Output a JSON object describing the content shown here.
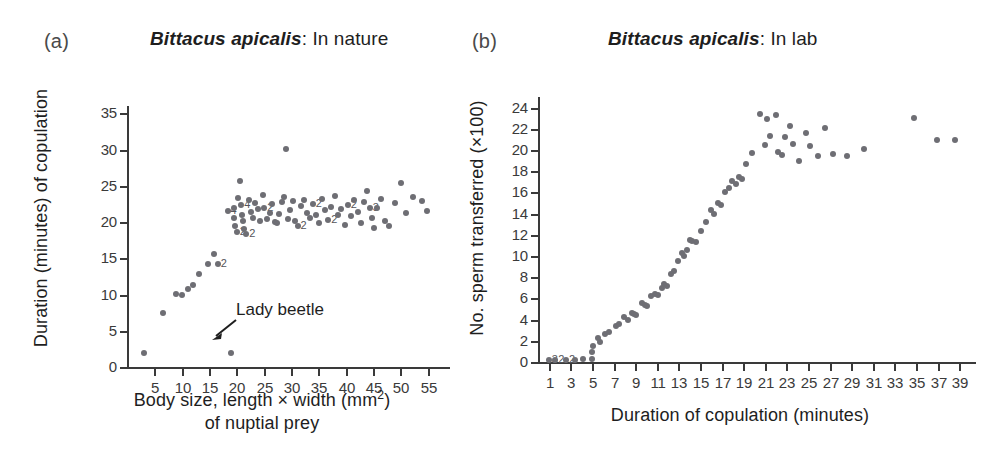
{
  "figure": {
    "background": "#ffffff",
    "dot_color": "#6e6e74",
    "axis_color": "#3a3a3a"
  },
  "panel_a": {
    "letter": "(a)",
    "title_species": "Bittacus apicalis",
    "title_rest": ": In nature",
    "xlabel_line1_pre": "Body size, length × width (mm",
    "xlabel_line1_sup": "2",
    "xlabel_line1_post": ")",
    "xlabel_line2": "of nuptial prey",
    "ylabel": "Duration (minutes) of copulation",
    "annotation": "Lady beetle"
  },
  "panel_b": {
    "letter": "(b)",
    "title_species": "Bittacus apicalis",
    "title_rest": ": In lab",
    "xlabel": "Duration of copulation (minutes)",
    "ylabel": "No. sperm transferred (×100)"
  },
  "chart_data": [
    {
      "type": "scatter",
      "panel": "a",
      "title": "Bittacus apicalis: In nature",
      "xlabel": "Body size, length x width (mm2) of nuptial prey",
      "ylabel": "Duration (minutes) of copulation",
      "xlim": [
        0,
        58
      ],
      "ylim": [
        0,
        36
      ],
      "xticks": [
        5,
        10,
        15,
        20,
        25,
        30,
        35,
        40,
        45,
        50,
        55
      ],
      "yticks": [
        0,
        5,
        10,
        15,
        20,
        25,
        30,
        35
      ],
      "grid": false,
      "legend": null,
      "annotations": [
        {
          "text": "Lady beetle",
          "points_to_x": 19.0,
          "points_to_y": 2.0
        }
      ],
      "points": [
        {
          "x": 3.2,
          "y": 2.0
        },
        {
          "x": 6.6,
          "y": 7.4
        },
        {
          "x": 9.0,
          "y": 10.1
        },
        {
          "x": 10.1,
          "y": 10.0
        },
        {
          "x": 11.2,
          "y": 10.8
        },
        {
          "x": 12.1,
          "y": 11.3
        },
        {
          "x": 13.1,
          "y": 12.8
        },
        {
          "x": 14.9,
          "y": 14.2
        },
        {
          "x": 16.0,
          "y": 15.6
        },
        {
          "x": 16.6,
          "y": 14.2,
          "n": 2
        },
        {
          "x": 19.0,
          "y": 2.0
        },
        {
          "x": 18.4,
          "y": 21.5,
          "n": 4
        },
        {
          "x": 19.6,
          "y": 22.0
        },
        {
          "x": 19.6,
          "y": 20.6
        },
        {
          "x": 19.8,
          "y": 19.5
        },
        {
          "x": 20.1,
          "y": 18.6,
          "n": 2
        },
        {
          "x": 20.3,
          "y": 23.3
        },
        {
          "x": 20.6,
          "y": 25.7
        },
        {
          "x": 20.9,
          "y": 22.3,
          "n": 4
        },
        {
          "x": 21.0,
          "y": 21.0
        },
        {
          "x": 21.2,
          "y": 20.2
        },
        {
          "x": 21.4,
          "y": 19.0
        },
        {
          "x": 21.8,
          "y": 18.4,
          "n": 2
        },
        {
          "x": 22.3,
          "y": 23.1
        },
        {
          "x": 22.6,
          "y": 21.4
        },
        {
          "x": 23.0,
          "y": 20.5
        },
        {
          "x": 23.4,
          "y": 22.6
        },
        {
          "x": 23.9,
          "y": 21.8
        },
        {
          "x": 24.3,
          "y": 20.2
        },
        {
          "x": 24.8,
          "y": 23.7
        },
        {
          "x": 25.1,
          "y": 22.0,
          "n": 2
        },
        {
          "x": 25.6,
          "y": 20.4
        },
        {
          "x": 26.1,
          "y": 21.3
        },
        {
          "x": 26.6,
          "y": 22.5
        },
        {
          "x": 27.0,
          "y": 20.0
        },
        {
          "x": 27.4,
          "y": 19.9
        },
        {
          "x": 27.9,
          "y": 21.1
        },
        {
          "x": 28.3,
          "y": 22.8
        },
        {
          "x": 28.7,
          "y": 23.4
        },
        {
          "x": 29.1,
          "y": 30.1
        },
        {
          "x": 29.4,
          "y": 20.4
        },
        {
          "x": 29.9,
          "y": 21.7
        },
        {
          "x": 30.3,
          "y": 22.9
        },
        {
          "x": 30.8,
          "y": 20.1
        },
        {
          "x": 31.2,
          "y": 19.4,
          "n": 2
        },
        {
          "x": 31.9,
          "y": 22.2
        },
        {
          "x": 32.4,
          "y": 23.0
        },
        {
          "x": 32.9,
          "y": 21.2
        },
        {
          "x": 33.4,
          "y": 20.6
        },
        {
          "x": 34.0,
          "y": 22.5,
          "n": 2
        },
        {
          "x": 34.6,
          "y": 21.0
        },
        {
          "x": 35.1,
          "y": 19.8
        },
        {
          "x": 35.7,
          "y": 23.2
        },
        {
          "x": 36.2,
          "y": 21.6
        },
        {
          "x": 36.8,
          "y": 20.3,
          "n": 2
        },
        {
          "x": 37.4,
          "y": 22.1
        },
        {
          "x": 38.0,
          "y": 23.6
        },
        {
          "x": 38.6,
          "y": 20.9
        },
        {
          "x": 39.2,
          "y": 21.8
        },
        {
          "x": 39.8,
          "y": 19.6
        },
        {
          "x": 40.4,
          "y": 22.4,
          "n": 2
        },
        {
          "x": 41.0,
          "y": 20.8
        },
        {
          "x": 41.6,
          "y": 23.0
        },
        {
          "x": 42.2,
          "y": 21.4
        },
        {
          "x": 42.8,
          "y": 19.9
        },
        {
          "x": 43.4,
          "y": 22.7
        },
        {
          "x": 44.0,
          "y": 24.3
        },
        {
          "x": 44.4,
          "y": 22.0,
          "n": 3
        },
        {
          "x": 44.8,
          "y": 20.5
        },
        {
          "x": 45.2,
          "y": 19.2
        },
        {
          "x": 45.8,
          "y": 21.9
        },
        {
          "x": 46.4,
          "y": 23.2
        },
        {
          "x": 47.2,
          "y": 20.1
        },
        {
          "x": 48.0,
          "y": 19.4
        },
        {
          "x": 49.0,
          "y": 22.6
        },
        {
          "x": 50.2,
          "y": 25.4
        },
        {
          "x": 51.0,
          "y": 21.2
        },
        {
          "x": 52.3,
          "y": 23.4
        },
        {
          "x": 54.0,
          "y": 22.9
        },
        {
          "x": 54.8,
          "y": 21.5
        }
      ]
    },
    {
      "type": "scatter",
      "panel": "b",
      "title": "Bittacus apicalis: In lab",
      "xlabel": "Duration of copulation (minutes)",
      "ylabel": "No. sperm transferred (x100)",
      "xlim": [
        0,
        40
      ],
      "ylim": [
        0,
        25
      ],
      "xticks": [
        1,
        3,
        5,
        7,
        9,
        11,
        13,
        15,
        17,
        19,
        21,
        23,
        25,
        27,
        29,
        31,
        33,
        35,
        37,
        39
      ],
      "yticks": [
        0,
        2,
        4,
        6,
        8,
        10,
        12,
        14,
        16,
        18,
        20,
        22,
        24
      ],
      "grid": false,
      "legend": null,
      "annotations": [],
      "points": [
        {
          "x": 1.0,
          "y": 0.15,
          "n": 3
        },
        {
          "x": 1.6,
          "y": 0.15,
          "n": 2
        },
        {
          "x": 2.6,
          "y": 0.15,
          "n": 2
        },
        {
          "x": 3.4,
          "y": 0.2
        },
        {
          "x": 4.2,
          "y": 0.25
        },
        {
          "x": 5.0,
          "y": 0.3
        },
        {
          "x": 5.0,
          "y": 0.9
        },
        {
          "x": 5.1,
          "y": 1.5
        },
        {
          "x": 5.6,
          "y": 2.3
        },
        {
          "x": 5.7,
          "y": 1.9
        },
        {
          "x": 6.2,
          "y": 2.6
        },
        {
          "x": 6.6,
          "y": 2.8
        },
        {
          "x": 7.2,
          "y": 3.4
        },
        {
          "x": 7.5,
          "y": 3.6
        },
        {
          "x": 8.0,
          "y": 4.2
        },
        {
          "x": 8.3,
          "y": 4.0
        },
        {
          "x": 8.7,
          "y": 4.6
        },
        {
          "x": 8.9,
          "y": 4.5
        },
        {
          "x": 9.1,
          "y": 4.4
        },
        {
          "x": 9.6,
          "y": 5.6
        },
        {
          "x": 9.9,
          "y": 5.4
        },
        {
          "x": 10.1,
          "y": 5.3
        },
        {
          "x": 10.5,
          "y": 6.2
        },
        {
          "x": 10.8,
          "y": 6.4
        },
        {
          "x": 11.1,
          "y": 6.3
        },
        {
          "x": 11.5,
          "y": 7.0
        },
        {
          "x": 11.7,
          "y": 7.4
        },
        {
          "x": 11.9,
          "y": 7.2
        },
        {
          "x": 12.3,
          "y": 8.3
        },
        {
          "x": 12.6,
          "y": 8.6
        },
        {
          "x": 13.0,
          "y": 9.5
        },
        {
          "x": 13.3,
          "y": 10.3
        },
        {
          "x": 13.5,
          "y": 10.0
        },
        {
          "x": 13.8,
          "y": 10.6
        },
        {
          "x": 14.1,
          "y": 11.5
        },
        {
          "x": 14.3,
          "y": 11.4
        },
        {
          "x": 14.6,
          "y": 11.3
        },
        {
          "x": 15.1,
          "y": 12.4
        },
        {
          "x": 15.6,
          "y": 13.2
        },
        {
          "x": 16.0,
          "y": 14.3
        },
        {
          "x": 16.3,
          "y": 14.0
        },
        {
          "x": 16.7,
          "y": 15.0
        },
        {
          "x": 16.9,
          "y": 14.8
        },
        {
          "x": 17.3,
          "y": 16.0
        },
        {
          "x": 17.7,
          "y": 16.4
        },
        {
          "x": 18.0,
          "y": 17.1
        },
        {
          "x": 18.3,
          "y": 16.8
        },
        {
          "x": 18.6,
          "y": 17.5
        },
        {
          "x": 18.9,
          "y": 17.3
        },
        {
          "x": 19.3,
          "y": 18.7
        },
        {
          "x": 19.8,
          "y": 19.7
        },
        {
          "x": 20.6,
          "y": 23.4
        },
        {
          "x": 21.2,
          "y": 22.9
        },
        {
          "x": 21.0,
          "y": 20.5
        },
        {
          "x": 21.5,
          "y": 21.3
        },
        {
          "x": 22.0,
          "y": 23.3
        },
        {
          "x": 22.2,
          "y": 19.8
        },
        {
          "x": 22.6,
          "y": 19.5
        },
        {
          "x": 22.9,
          "y": 21.2
        },
        {
          "x": 23.3,
          "y": 22.3
        },
        {
          "x": 23.6,
          "y": 20.6
        },
        {
          "x": 24.2,
          "y": 19.0
        },
        {
          "x": 24.8,
          "y": 21.6
        },
        {
          "x": 25.2,
          "y": 20.4
        },
        {
          "x": 25.9,
          "y": 19.4
        },
        {
          "x": 26.6,
          "y": 22.1
        },
        {
          "x": 27.3,
          "y": 19.6
        },
        {
          "x": 28.6,
          "y": 19.4
        },
        {
          "x": 30.2,
          "y": 20.1
        },
        {
          "x": 34.8,
          "y": 23.0
        },
        {
          "x": 36.9,
          "y": 20.9
        },
        {
          "x": 38.6,
          "y": 20.9
        }
      ]
    }
  ]
}
